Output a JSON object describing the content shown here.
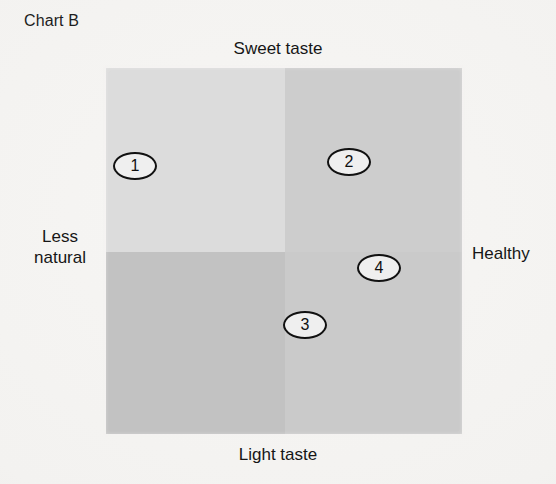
{
  "chart_data": {
    "type": "scatter",
    "title": "Chart B",
    "subtype": "perceptual-map",
    "axes": {
      "top_label": "Sweet taste",
      "bottom_label": "Light taste",
      "left_label": "Less natural",
      "right_label": "Healthy",
      "xlabel": "Less natural — Healthy",
      "ylabel": "Light taste — Sweet taste",
      "grid": true,
      "xlim": [
        0,
        100
      ],
      "ylim": [
        0,
        100
      ]
    },
    "quadrants": [
      {
        "name": "top-left",
        "shade": "#dcdcdc"
      },
      {
        "name": "top-right",
        "shade": "#cdcdcd"
      },
      {
        "name": "bottom-left",
        "shade": "#c2c2c2"
      },
      {
        "name": "bottom-right",
        "shade": "#cacaca"
      }
    ],
    "points": [
      {
        "label": "1",
        "x": 8,
        "y": 73,
        "px": 135,
        "py": 166,
        "quadrant": "top-left"
      },
      {
        "label": "2",
        "x": 68,
        "y": 74,
        "px": 349,
        "py": 162,
        "quadrant": "top-right"
      },
      {
        "label": "3",
        "x": 56,
        "y": 30,
        "px": 305,
        "py": 325,
        "quadrant": "bottom-right"
      },
      {
        "label": "4",
        "x": 77,
        "y": 45,
        "px": 379,
        "py": 268,
        "quadrant": "bottom-right"
      }
    ]
  },
  "colors": {
    "background": "#f5f4f2",
    "text": "#161616",
    "marker_outline": "#111111",
    "marker_fill": "#efefef"
  }
}
